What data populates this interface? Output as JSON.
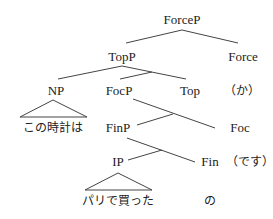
{
  "tree": {
    "nodes": {
      "forcep": "ForceP",
      "topp": "TopP",
      "force": "Force",
      "np": "NP",
      "focp": "FocP",
      "top": "Top",
      "ka": "（か）",
      "np_leaf": "この時計は",
      "finp": "FinP",
      "foc": "Foc",
      "ip": "IP",
      "fin": "Fin",
      "desu": "（です）",
      "ip_leaf": "パリで買った",
      "no": "の"
    },
    "line_color": "#444444"
  }
}
